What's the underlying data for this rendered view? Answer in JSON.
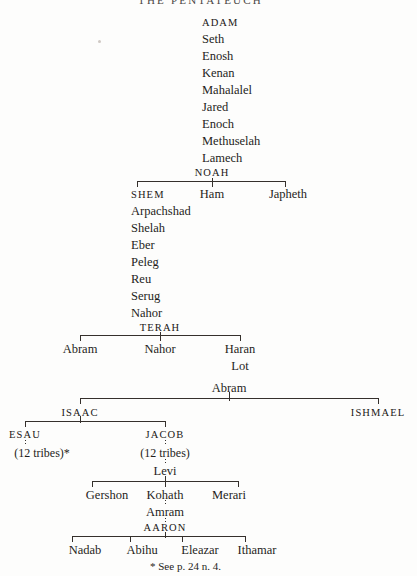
{
  "document": {
    "title": "THE PENTATEUCH",
    "footnote": "* See p. 24 n. 4."
  },
  "adam_line": {
    "root": "ADAM",
    "descendants": [
      "Seth",
      "Enosh",
      "Kenan",
      "Mahalalel",
      "Jared",
      "Enoch",
      "Methuselah",
      "Lamech"
    ],
    "terminal": "NOAH"
  },
  "noah_sons": {
    "parent": "NOAH",
    "children": [
      "SHEM",
      "Ham",
      "Japheth"
    ]
  },
  "shem_line": {
    "root": "SHEM",
    "descendants": [
      "Arpachshad",
      "Shelah",
      "Eber",
      "Peleg",
      "Reu",
      "Serug",
      "Nahor"
    ],
    "terminal": "TERAH"
  },
  "terah_sons": {
    "parent": "TERAH",
    "children": [
      "Abram",
      "Nahor",
      "Haran"
    ],
    "haran_son": "Lot"
  },
  "abram_sons": {
    "parent": "Abram",
    "children": [
      "ISAAC",
      "ISHMAEL"
    ]
  },
  "isaac_sons": {
    "parent": "ISAAC",
    "children": [
      "ESAU",
      "JACOB"
    ]
  },
  "esau_branch": {
    "name": "ESAU",
    "note": "(12 tribes)*"
  },
  "jacob_branch": {
    "name": "JACOB",
    "note": "(12 tribes)",
    "son": "Levi"
  },
  "levi_sons": {
    "parent": "Levi",
    "children": [
      "Gershon",
      "Kohath",
      "Merari"
    ]
  },
  "kohath_line": {
    "son": "Amram",
    "grandson": "AARON"
  },
  "aaron_sons": {
    "parent": "AARON",
    "children": [
      "Nadab",
      "Abihu",
      "Eleazar",
      "Ithamar"
    ]
  },
  "colors": {
    "ink": "#1f1d1b",
    "rule": "#35302c",
    "paper": "#fdfdfc"
  }
}
